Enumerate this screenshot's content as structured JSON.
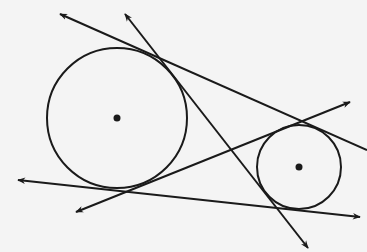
{
  "diagram": {
    "background": "#f4f4f4",
    "stroke_color": "#1a1a1a",
    "circles": [
      {
        "name": "large-circle",
        "cx": 117,
        "cy": 118,
        "r": 70,
        "center_dot": true
      },
      {
        "name": "small-circle",
        "cx": 299,
        "cy": 167,
        "r": 42,
        "center_dot": true
      }
    ],
    "lines": [
      {
        "name": "top-external-tangent",
        "x1": 60,
        "y1": 14,
        "x2": 367,
        "y2": 150,
        "arrow_start": true,
        "arrow_end": false
      },
      {
        "name": "transversal-line",
        "x1": 125,
        "y1": 14,
        "x2": 308,
        "y2": 248,
        "arrow_start": true,
        "arrow_end": true
      },
      {
        "name": "internal-tangent",
        "x1": 350,
        "y1": 102,
        "x2": 76,
        "y2": 212,
        "arrow_start": true,
        "arrow_end": true
      },
      {
        "name": "bottom-external-tangent",
        "x1": 18,
        "y1": 180,
        "x2": 360,
        "y2": 217,
        "arrow_start": true,
        "arrow_end": true
      }
    ]
  }
}
